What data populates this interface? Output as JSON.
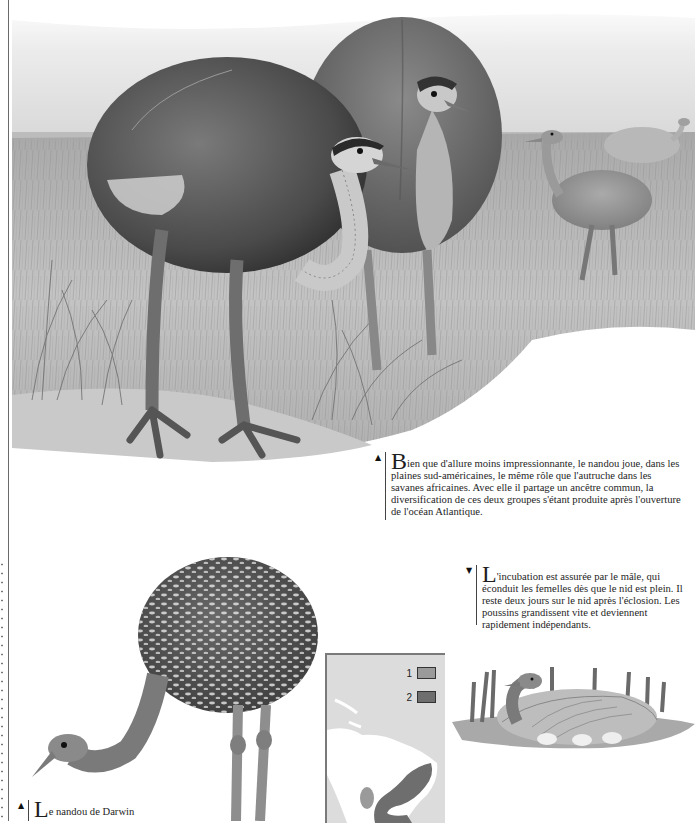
{
  "page": {
    "language": "fr"
  },
  "illustrations": {
    "main_scene": {
      "description": "Nandous dans une prairie sud-américaine — deux adultes au premier plan, deux au loin",
      "colors": {
        "sky": "#e6e6e6",
        "grass": "#b9b9b9",
        "plumage": "#6f6f6f"
      }
    },
    "darwin_rhea": {
      "description": "Nandou de Darwin, plumage tacheté de blanc"
    },
    "nest": {
      "description": "Mâle couvant les œufs au nid"
    }
  },
  "captions": [
    {
      "marker": "▲",
      "dropcap": "B",
      "text": "ien que d'allure moins impressionnante, le nandou joue, dans les plaines sud-américaines, le même rôle que l'autruche dans les savanes africaines. Avec elle il partage un ancêtre commun, la diversification de ces deux groupes s'étant produite après l'ouverture de l'océan Atlantique."
    },
    {
      "marker": "▼",
      "dropcap": "L",
      "text": "'incubation est assurée par le mâle, qui éconduit les femelles dès que le nid est plein. Il reste deux jours sur le nid après l'éclosion. Les poussins grandissent vite et deviennent rapidement indépendants."
    },
    {
      "marker": "▲",
      "dropcap": "L",
      "text": "e nandou de Darwin"
    }
  ],
  "map": {
    "region": "Amérique du Sud",
    "legend": [
      {
        "number": "1",
        "color": "#9a9a9a"
      },
      {
        "number": "2",
        "color": "#6e6e6e"
      }
    ],
    "colors": {
      "ocean": "#dcdcdc",
      "land": "#ffffff",
      "border": "#7a7a7a"
    }
  }
}
